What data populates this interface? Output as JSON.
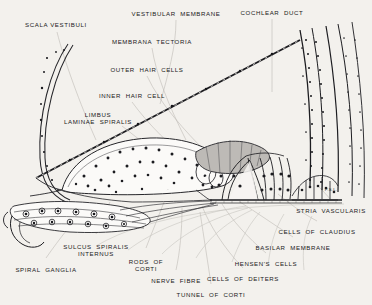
{
  "figure": {
    "background_color": "#f3f1ed",
    "ink_color": "#19191b",
    "inscription": "P.S.L."
  },
  "labels": [
    {
      "name": "scala-vestibuli",
      "text": "SCALA VESTIBULI",
      "cx": 56,
      "y": 21,
      "lines": 1
    },
    {
      "name": "vestibular-membrane",
      "text": "VESTIBULAR  MEMBRANE",
      "cx": 176,
      "y": 10,
      "lines": 1
    },
    {
      "name": "cochlear-duct",
      "text": "COCHLEAR  DUCT",
      "cx": 272,
      "y": 9,
      "lines": 1
    },
    {
      "name": "membrana-tectoria",
      "text": "MEMBRANA  TECTORIA",
      "cx": 152,
      "y": 38,
      "lines": 1
    },
    {
      "name": "outer-hair-cells",
      "text": "OUTER  HAIR  CELLS",
      "cx": 147,
      "y": 66,
      "lines": 1
    },
    {
      "name": "inner-hair-cell",
      "text": "INNER  HAIR  CELL",
      "cx": 132,
      "y": 92,
      "lines": 1
    },
    {
      "name": "limbus-laminae-spiralis",
      "text": "LIMBUS\nLAMINAE  SPIRALIS",
      "cx": 98,
      "y": 111,
      "lines": 2
    },
    {
      "name": "stria-vascularis",
      "text": "STRIA  VASCULARIS",
      "cx": 331,
      "y": 207,
      "lines": 1
    },
    {
      "name": "cells-of-claudius",
      "text": "CELLS  OF  CLAUDIUS",
      "cx": 317,
      "y": 228,
      "lines": 1
    },
    {
      "name": "basilar-membrane",
      "text": "BASILAR  MEMBRANE",
      "cx": 293,
      "y": 244,
      "lines": 1
    },
    {
      "name": "hensens-cells",
      "text": "HENSEN'S  CELLS",
      "cx": 266,
      "y": 260,
      "lines": 1
    },
    {
      "name": "cells-of-deiters",
      "text": "CELLS  OF  DEITERS",
      "cx": 243,
      "y": 275,
      "lines": 1
    },
    {
      "name": "sulcus-spiralis-internus",
      "text": "SULCUS  SPIRALIS\nINTERNUS",
      "cx": 96,
      "y": 243,
      "lines": 2
    },
    {
      "name": "spiral-ganglia",
      "text": "SPIRAL  GANGLIA",
      "cx": 46,
      "y": 266,
      "lines": 1
    },
    {
      "name": "rods-of-corti",
      "text": "RODS  OF\nCORTI",
      "cx": 146,
      "y": 258,
      "lines": 2
    },
    {
      "name": "nerve-fibre",
      "text": "NERVE  FIBRE",
      "cx": 176,
      "y": 277,
      "lines": 1
    },
    {
      "name": "tunnel-of-corti",
      "text": "TUNNEL  OF  CORTI",
      "cx": 211,
      "y": 291,
      "lines": 1
    }
  ]
}
